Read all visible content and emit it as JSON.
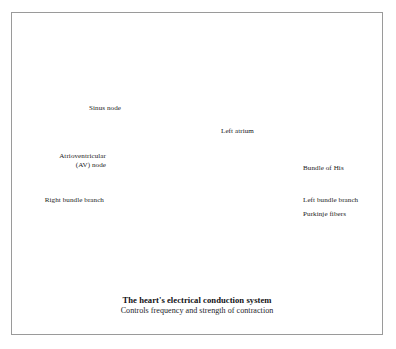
{
  "figure": {
    "domain": "medical-illustration",
    "style": "grayscale halftone anatomical cutaway",
    "background_color": "#ffffff",
    "frame_color": "#9a9a9a",
    "leader_line_color": "#2b2b2b"
  },
  "caption": {
    "title": "The heart's electrical conduction system",
    "subtitle": "Controls frequency and strength of contraction"
  },
  "callouts": [
    {
      "id": "sinus-node",
      "label": "Sinus node",
      "side": "left",
      "lines": [
        "Sinus node"
      ],
      "text_x": 118,
      "text_y": 104,
      "leader": [
        [
          121,
          108
        ],
        [
          141,
          108
        ]
      ]
    },
    {
      "id": "av-node",
      "label": "Atrioventricular (AV) node",
      "side": "left",
      "lines": [
        "Atrioventricular",
        "(AV) node"
      ],
      "text_x": 103,
      "text_y": 152,
      "leader": [
        [
          106,
          170
        ],
        [
          150,
          170
        ]
      ]
    },
    {
      "id": "right-bundle-branch",
      "label": "Right bundle branch",
      "side": "left",
      "lines": [
        "Right bundle branch"
      ],
      "text_x": 101,
      "text_y": 197,
      "leader": [
        [
          104,
          201
        ],
        [
          152,
          201
        ]
      ]
    },
    {
      "id": "bundle-of-his",
      "label": "Bundle of His",
      "side": "right",
      "lines": [
        "Bundle of His"
      ],
      "text_x": 303,
      "text_y": 165,
      "leader": [
        [
          300,
          169
        ],
        [
          268,
          169
        ]
      ]
    },
    {
      "id": "left-bundle-branch",
      "label": "Left bundle branch",
      "side": "right",
      "lines": [
        "Left bundle branch"
      ],
      "text_x": 303,
      "text_y": 197,
      "leader": [
        [
          300,
          201
        ],
        [
          243,
          201
        ]
      ]
    },
    {
      "id": "purkinje-fibers",
      "label": "Purkinje fibers",
      "side": "right",
      "lines": [
        "Purkinje fibers"
      ],
      "text_x": 303,
      "text_y": 211,
      "leader": [
        [
          300,
          215
        ],
        [
          229,
          215
        ],
        [
          229,
          232
        ]
      ]
    }
  ],
  "inline_labels": [
    {
      "id": "left-atrium",
      "label": "Left atrium",
      "x": 221,
      "y": 131
    }
  ],
  "anatomy_parts": [
    "aortic arch",
    "superior vena cava",
    "pulmonary trunk",
    "right atrium",
    "left atrium",
    "left atrial appendage",
    "interventricular septum",
    "left ventricle",
    "right ventricle",
    "papillary muscles",
    "trabeculae carneae",
    "myocardium",
    "epicardial fat rim"
  ],
  "palette": {
    "ink_black": "#131316",
    "myocardium_dark": "#2a2a2d",
    "myocardium_mid": "#6e6e72",
    "tissue_light": "#c9c9cb",
    "tissue_lighter": "#e3e3e4",
    "highlight": "#f6f6f6",
    "conduction_path": "#f2f2f2",
    "vessel_gray": "#8a8a8e"
  }
}
